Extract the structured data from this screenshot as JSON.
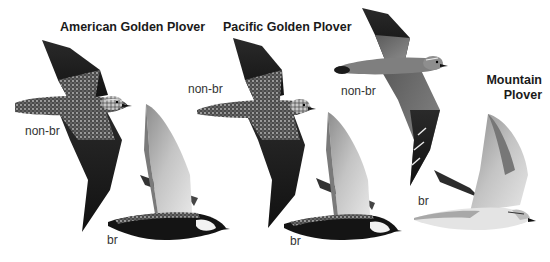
{
  "figure": {
    "species": [
      {
        "name": "American Golden Plover",
        "plumages": [
          {
            "label": "non-br",
            "pose": "flying, upperside, wings raised"
          },
          {
            "label": "br",
            "pose": "flying, side view, black underparts"
          }
        ]
      },
      {
        "name": "Pacific Golden Plover",
        "plumages": [
          {
            "label": "non-br",
            "pose": "flying, upperside, wings raised"
          },
          {
            "label": "br",
            "pose": "flying, side view, black underparts"
          }
        ]
      },
      {
        "name_line1": "Mountain",
        "name_line2": "Plover",
        "plumages": [
          {
            "label": "non-br",
            "pose": "flying, upperside, plain brown"
          },
          {
            "label": "br",
            "pose": "flying, side view, pale underparts"
          }
        ]
      }
    ],
    "colors": {
      "background": "#ffffff",
      "dark_plumage": "#1c1c1c",
      "mid_plumage": "#6e6e6e",
      "pale_plumage": "#c9c9c9",
      "text": "#1a1a1a"
    }
  }
}
